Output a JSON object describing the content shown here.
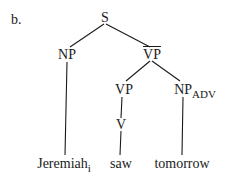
{
  "example_label": "b.",
  "tree": {
    "root": "S",
    "nodes": {
      "s": "S",
      "np": "NP",
      "vp_bar": "VP",
      "vp": "VP",
      "np_adv": "NP",
      "np_adv_sub": "ADV",
      "v": "V"
    },
    "leaves": {
      "jeremiah": "Jeremiah",
      "jeremiah_index": "i",
      "saw": "saw",
      "tomorrow": "tomorrow"
    }
  }
}
